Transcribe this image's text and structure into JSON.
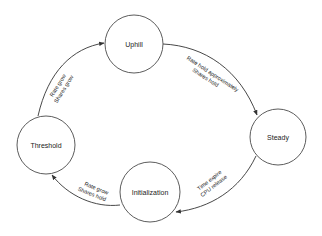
{
  "diagram": {
    "type": "state-transition",
    "colors": {
      "background": "#ffffff",
      "stroke": "#4a4a4a",
      "text": "#222222"
    },
    "states": [
      {
        "id": "uphill",
        "label": "Uphill"
      },
      {
        "id": "steady",
        "label": "Steady"
      },
      {
        "id": "initialization",
        "label": "Initialization"
      },
      {
        "id": "threshold",
        "label": "Threshold"
      }
    ],
    "transitions": [
      {
        "from": "uphill",
        "to": "steady",
        "label_line1": "Rate hold approximately",
        "label_line2": "Shares hold"
      },
      {
        "from": "steady",
        "to": "initialization",
        "label_line1": "Time expire",
        "label_line2": "CPU release"
      },
      {
        "from": "initialization",
        "to": "threshold",
        "label_line1": "Rate grow",
        "label_line2": "Shares hold"
      },
      {
        "from": "threshold",
        "to": "uphill",
        "label_line1": "Rate grow",
        "label_line2": "Shares grow"
      }
    ]
  }
}
